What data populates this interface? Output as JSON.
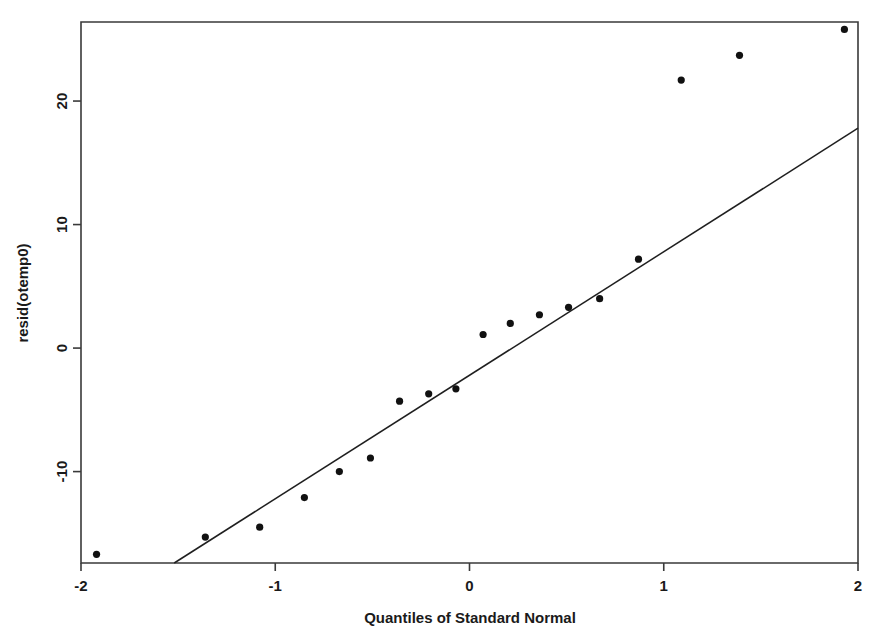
{
  "figure": {
    "kind": "qq-plot",
    "background_color": "#ffffff",
    "point_color": "#111111",
    "line_color": "#1f1f1f",
    "axis_color": "#3a3a3a"
  },
  "chart_data": {
    "type": "scatter",
    "title": "",
    "subtitle": "",
    "xlabel": "Quantiles of Standard Normal",
    "ylabel": "resid(otemp0)",
    "xlim": [
      -2.0,
      2.0
    ],
    "ylim": [
      -17.4,
      26.4
    ],
    "xticks": [
      -2,
      -1,
      0,
      1,
      2
    ],
    "xticklabels": [
      "-2",
      "-1",
      "0",
      "1",
      "2"
    ],
    "yticks": [
      -10,
      0,
      10,
      20
    ],
    "yticklabels": [
      "-10",
      "0",
      "10",
      "20"
    ],
    "grid": false,
    "legend": false,
    "legend_position": "none",
    "x": [
      -1.92,
      -1.36,
      -1.08,
      -0.85,
      -0.67,
      -0.51,
      -0.36,
      -0.21,
      -0.07,
      0.07,
      0.21,
      0.36,
      0.51,
      0.67,
      0.87,
      1.09,
      1.39,
      1.93
    ],
    "y": [
      -16.7,
      -15.3,
      -14.5,
      -12.1,
      -10.0,
      -8.9,
      -4.3,
      -3.7,
      -3.3,
      1.1,
      2.0,
      2.7,
      3.3,
      4.0,
      7.2,
      21.7,
      23.7,
      25.8
    ],
    "point_count": 18,
    "reference_line": {
      "name": "qq-reference-line",
      "x_start": -1.52,
      "y_start": -17.4,
      "x_end": 2.0,
      "y_end": 17.8,
      "slope": 10.0,
      "intercept": -2.2
    },
    "annotations": []
  }
}
